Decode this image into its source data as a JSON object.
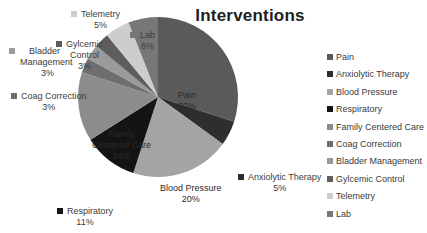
{
  "chart_data": {
    "type": "pie",
    "title": "Interventions",
    "categories": [
      "Pain",
      "Anxiolytic Therapy",
      "Blood Pressure",
      "Respiratory",
      "Family Centered Care",
      "Coag Correction",
      "Bladder Management",
      "Gylcemic Control",
      "Telemetry",
      "Lab"
    ],
    "values": [
      30,
      5,
      20,
      11,
      14,
      3,
      3,
      3,
      5,
      6
    ],
    "value_labels": [
      "30%",
      "5%",
      "20%",
      "11%",
      "14%",
      "3%",
      "3%",
      "3%",
      "5%",
      "6%"
    ],
    "colors": [
      "#5a5a5a",
      "#2e2e2e",
      "#a4a4a4",
      "#141414",
      "#8c8c8c",
      "#6e6e6e",
      "#9a9a9a",
      "#5e5e5e",
      "#cdcdcd",
      "#777777"
    ],
    "start_angle": "12 o'clock",
    "direction": "clockwise",
    "legend_position": "right",
    "grid": false
  },
  "title": "Interventions",
  "legend": [
    {
      "label": "Pain"
    },
    {
      "label": "Anxiolytic Therapy"
    },
    {
      "label": "Blood Pressure"
    },
    {
      "label": "Respiratory"
    },
    {
      "label": "Family Centered Care"
    },
    {
      "label": "Coag Correction"
    },
    {
      "label": "Bladder Management"
    },
    {
      "label": "Gylcemic Control"
    },
    {
      "label": "Telemetry"
    },
    {
      "label": "Lab"
    }
  ],
  "data_labels": {
    "pain": {
      "name": "Pain",
      "pct": "30%"
    },
    "anxiolytic": {
      "name": "Anxiolytic Therapy",
      "pct": "5%"
    },
    "blood_pressure": {
      "name": "Blood Pressure",
      "pct": "20%"
    },
    "respiratory": {
      "name": "Respiratory",
      "pct": "11%"
    },
    "family_line1": "Family",
    "family_line2": "Centered Care",
    "family_pct": "14%",
    "coag": {
      "name": "Coag Correction",
      "pct": "3%"
    },
    "bladder_line1": "Bladder",
    "bladder_line2": "Management",
    "bladder_pct": "3%",
    "glycemic_line1": "Gylcemic",
    "glycemic_line2": "Control",
    "glycemic_pct": "3%",
    "telemetry": {
      "name": "Telemetry",
      "pct": "5%"
    },
    "lab": {
      "name": "Lab",
      "pct": "6%"
    }
  }
}
